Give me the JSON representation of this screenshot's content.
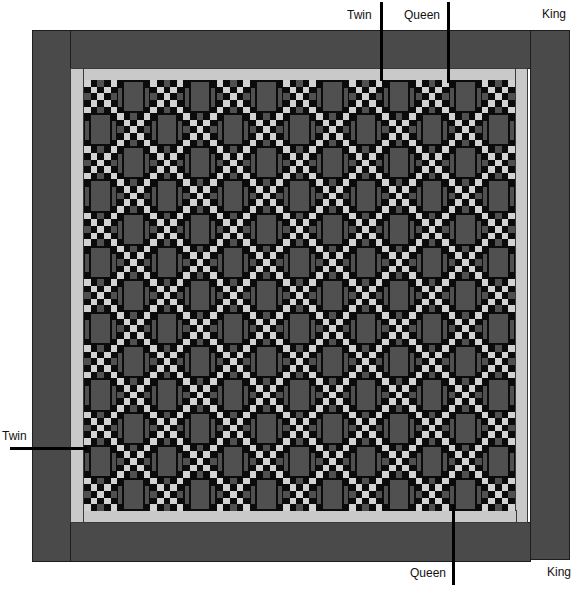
{
  "diagram": {
    "type": "quilt layout with bed-size cut lines",
    "grid": {
      "rows": 13,
      "cols": 13,
      "block_types": [
        "nine-patch checker",
        "rectangle block"
      ]
    },
    "colors": {
      "outer_border": "#4a4a4a",
      "inner_border": "#c9c9c9",
      "background_black": "#0b0b0b",
      "gray": "#505050",
      "light_square": "#d2d2d2"
    },
    "checker_pattern": [
      [
        "L",
        "D",
        "G",
        "D",
        "L"
      ],
      [
        "D",
        "L",
        "D",
        "L",
        "D"
      ],
      [
        "G",
        "D",
        "L",
        "D",
        "G"
      ],
      [
        "D",
        "L",
        "D",
        "L",
        "D"
      ],
      [
        "L",
        "D",
        "G",
        "D",
        "L"
      ]
    ]
  },
  "labels": {
    "top_twin": "Twin",
    "top_queen": "Queen",
    "top_king": "King",
    "left_twin": "Twin",
    "bottom_queen": "Queen",
    "bottom_king": "King"
  }
}
